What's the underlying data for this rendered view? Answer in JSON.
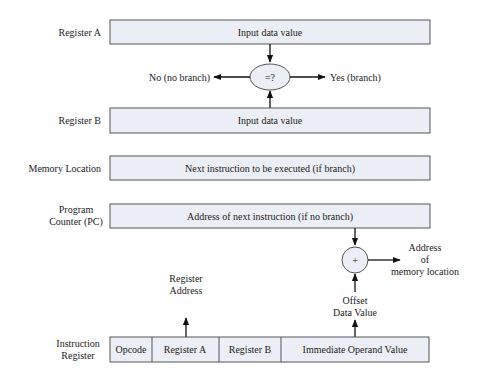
{
  "diagram": {
    "rows": {
      "register_a": {
        "label": "Register A",
        "content": "Input data value"
      },
      "register_b": {
        "label": "Register B",
        "content": "Input data value"
      },
      "memory_location": {
        "label": "Memory Location",
        "content": "Next instruction to be executed (if branch)"
      },
      "program_counter": {
        "label_line1": "Program",
        "label_line2": "Counter (PC)",
        "content": "Address of next instruction (if no branch)"
      },
      "instruction_register": {
        "label_line1": "Instruction",
        "label_line2": "Register",
        "fields": [
          "Opcode",
          "Register A",
          "Register B",
          "Immediate Operand Value"
        ]
      }
    },
    "comparator": {
      "symbol": "=?",
      "no_label": "No (no branch)",
      "yes_label": "Yes (branch)"
    },
    "adder": {
      "symbol": "+",
      "output_line1": "Address",
      "output_line2": "of",
      "output_line3": "memory location"
    },
    "register_address": {
      "line1": "Register",
      "line2": "Address"
    },
    "offset": {
      "line1": "Offset",
      "line2": "Data Value"
    }
  }
}
